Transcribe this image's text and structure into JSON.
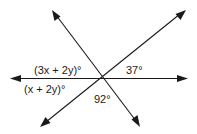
{
  "diagram": {
    "type": "intersecting-lines-angles",
    "labels": {
      "upper_left": "(3x + 2y)°",
      "lower_left": "(x + 2y)°",
      "upper_right": "37°",
      "bottom": "92°"
    },
    "colors": {
      "line": "#1a1a1a",
      "background": "#ffffff"
    }
  }
}
